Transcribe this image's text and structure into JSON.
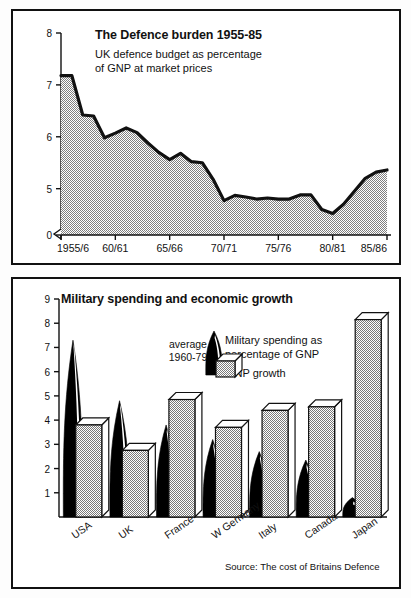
{
  "top_panel": {
    "title": "The Defence burden 1955-85",
    "subtitle_line1": "UK defence budget as percentage",
    "subtitle_line2": "of GNP at market prices"
  },
  "bottom_panel": {
    "title": "Military spending and economic growth",
    "legend_avg_line1": "average",
    "legend_avg_line2": "1960-79",
    "legend_military_line1": "Military spending as",
    "legend_military_line2": "percentage of GNP",
    "legend_gnp": "GNP growth",
    "source": "Source: The cost of Britains Defence"
  },
  "colors": {
    "ink": "#111111",
    "fill_gray": "#b0b0b0",
    "black_fill": "#000000",
    "paper": "#ffffff"
  },
  "chart_data": [
    {
      "type": "area",
      "title": "The Defence burden 1955-85",
      "subtitle": "UK defence budget as percentage of GNP at market prices",
      "xlabel": "",
      "ylabel": "",
      "ylim": [
        4.3,
        8
      ],
      "y_axis_break": true,
      "y_axis_zero_tick": "0",
      "yticks": [
        5,
        6,
        7,
        8
      ],
      "yticklabels": [
        "5",
        "6",
        "7",
        "8"
      ],
      "xticks": [
        "1955/6",
        "60/61",
        "65/66",
        "70/71",
        "75/76",
        "80/81",
        "85/86"
      ],
      "grid": false,
      "legend": "none",
      "x": [
        "1955/6",
        "1956/7",
        "1957/8",
        "1958/9",
        "1959/60",
        "1960/61",
        "1961/62",
        "1962/63",
        "1963/64",
        "1964/65",
        "1965/66",
        "1966/67",
        "1967/68",
        "1968/69",
        "1969/70",
        "1970/71",
        "1971/72",
        "1972/73",
        "1973/74",
        "1974/75",
        "1975/76",
        "1976/77",
        "1977/78",
        "1978/79",
        "1979/80",
        "1980/81",
        "1981/82",
        "1982/83",
        "1983/84",
        "1984/85",
        "1985/86"
      ],
      "values": [
        7.18,
        7.18,
        6.42,
        6.4,
        5.98,
        6.07,
        6.17,
        6.08,
        5.88,
        5.7,
        5.56,
        5.68,
        5.52,
        5.5,
        5.18,
        4.77,
        4.87,
        4.84,
        4.8,
        4.82,
        4.8,
        4.8,
        4.88,
        4.88,
        4.6,
        4.52,
        4.7,
        4.95,
        5.2,
        5.32,
        5.36
      ]
    },
    {
      "type": "bar",
      "title": "Military spending and economic growth",
      "subtitle": "average 1960-79",
      "xlabel": "",
      "ylabel": "",
      "ylim": [
        0,
        9
      ],
      "yticks": [
        1,
        2,
        3,
        4,
        5,
        6,
        7,
        8,
        9
      ],
      "yticklabels": [
        "1",
        "2",
        "3",
        "4",
        "5",
        "6",
        "7",
        "8",
        "9"
      ],
      "categories": [
        "USA",
        "UK",
        "France",
        "W Germany",
        "Italy",
        "Canada",
        "Japan"
      ],
      "grid": false,
      "legend": "inside",
      "series": [
        {
          "name": "Military spending as percentage of GNP",
          "style": "black-flame",
          "values": [
            7.3,
            4.8,
            3.8,
            3.2,
            2.7,
            2.35,
            0.8
          ]
        },
        {
          "name": "GNP growth",
          "style": "gray-block",
          "values": [
            3.8,
            2.75,
            4.85,
            3.7,
            4.4,
            4.55,
            8.15
          ]
        }
      ],
      "source": "Source: The cost of Britains Defence"
    }
  ]
}
